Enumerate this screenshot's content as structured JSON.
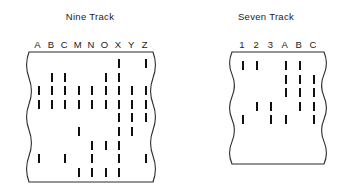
{
  "panels": [
    {
      "id": "nine-track",
      "title": "Nine Track",
      "columns": [
        "A",
        "B",
        "C",
        "M",
        "N",
        "O",
        "X",
        "Y",
        "Z"
      ],
      "rows": [
        {
          "row": 1,
          "marks": [
            7,
            9
          ]
        },
        {
          "row": 2,
          "marks": [
            2,
            3,
            6,
            7
          ]
        },
        {
          "row": 3,
          "marks": [
            1,
            2,
            3,
            4,
            5,
            6,
            7,
            8,
            9
          ]
        },
        {
          "row": 4,
          "marks": [
            1,
            2,
            3,
            4,
            5,
            6,
            7,
            8,
            9
          ]
        },
        {
          "row": 5,
          "marks": [
            7,
            8,
            9
          ]
        },
        {
          "row": 6,
          "marks": [
            4,
            7,
            8
          ]
        },
        {
          "row": 7,
          "marks": [
            5,
            6,
            7
          ]
        },
        {
          "row": 8,
          "marks": [
            1,
            3,
            5,
            7,
            9
          ]
        },
        {
          "row": 9,
          "marks": [
            4,
            5,
            6,
            7
          ]
        }
      ]
    },
    {
      "id": "seven-track",
      "title": "Seven Track",
      "columns": [
        "1",
        "2",
        "3",
        "A",
        "B",
        "C"
      ],
      "rows": [
        {
          "row": 1,
          "marks": [
            1,
            2,
            4,
            5
          ]
        },
        {
          "row": 2,
          "marks": [
            4,
            5,
            6
          ]
        },
        {
          "row": 3,
          "marks": [
            4,
            5,
            6
          ]
        },
        {
          "row": 4,
          "marks": [
            2,
            3,
            5,
            6
          ]
        },
        {
          "row": 5,
          "marks": [
            1,
            3,
            4,
            6
          ]
        }
      ]
    }
  ],
  "style": {
    "ink": "#111111",
    "border": "#2b2b2b",
    "background": "#ffffff"
  },
  "geometry": {
    "nine_track": {
      "panel_left": 10,
      "panel_width": 160,
      "tape_left": 19,
      "tape_top": 52,
      "tape_width": 124,
      "tape_height": 130,
      "col_gap": 13.4,
      "col_first": 8.5,
      "row_gap": 13.6,
      "row_first": 7,
      "mark_height": 9
    },
    "seven_track": {
      "panel_left": 186,
      "panel_width": 160,
      "tape_left": 46,
      "tape_top": 52,
      "tape_width": 92,
      "tape_height": 112,
      "col_gap": 14.2,
      "col_first": 10,
      "row_gap": 13.6,
      "row_first": 9,
      "mark_height": 9
    }
  }
}
